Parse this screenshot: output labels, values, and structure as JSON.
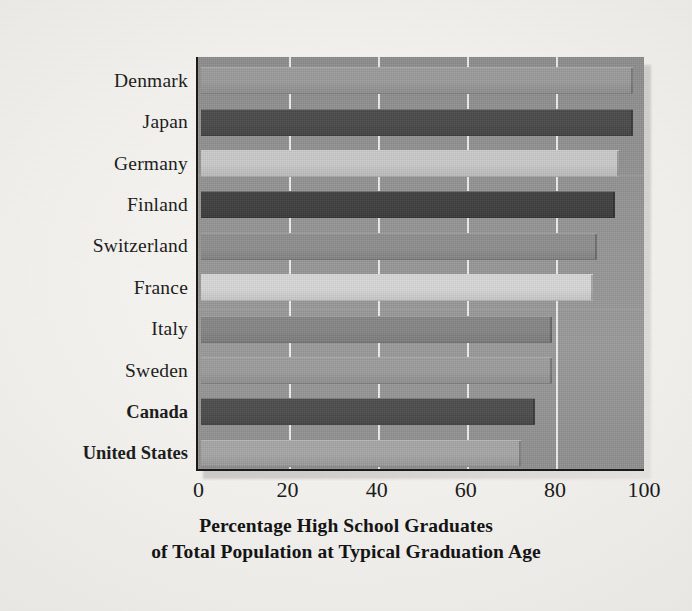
{
  "chart_data": {
    "type": "bar",
    "orientation": "horizontal",
    "title": "Percentage High School Graduates of Total Population at Typical Graduation Age",
    "title_line1": "Percentage High School Graduates",
    "title_line2": "of Total Population at Typical Graduation Age",
    "xlabel": "Percentage High School Graduates of Total Population at Typical Graduation Age",
    "ylabel": "",
    "xlim": [
      0,
      100
    ],
    "xticks": [
      0,
      20,
      40,
      60,
      80,
      100
    ],
    "xtick_labels": [
      "0",
      "20",
      "40",
      "60",
      "80",
      "100"
    ],
    "grid": true,
    "grid_axis": "x",
    "legend": false,
    "categories": [
      "Denmark",
      "Japan",
      "Germany",
      "Finland",
      "Switzerland",
      "France",
      "Italy",
      "Sweden",
      "Canada",
      "United States"
    ],
    "values": [
      97,
      97,
      94,
      93,
      89,
      88,
      79,
      79,
      75,
      72
    ],
    "highlighted": [
      "Canada",
      "United States"
    ],
    "bar_colors": [
      "#9b9b9b",
      "#4a4a4a",
      "#c9c9c9",
      "#3f3f3f",
      "#8e8e8e",
      "#d7d7d7",
      "#868686",
      "#9c9c9c",
      "#4c4c4c",
      "#a6a6a6"
    ],
    "grid_color": "#ffffff",
    "plot_background": "#949494",
    "page_background": "#f2f1ee",
    "axis_color": "#1a1a1a",
    "text_color": "#1b1b1b"
  }
}
